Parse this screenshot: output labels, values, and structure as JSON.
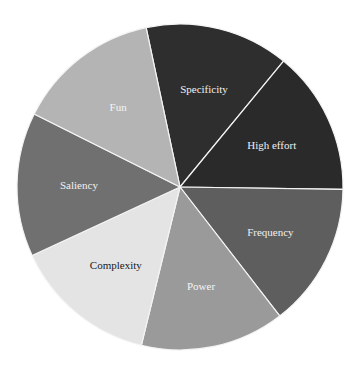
{
  "chart_data": {
    "type": "pie",
    "title": "",
    "start_angle_deg": 102,
    "direction": "clockwise",
    "slices": [
      {
        "label": "Specificity",
        "value": 14.29,
        "color": "#2e2e2e",
        "text_color": "#f0f0f0"
      },
      {
        "label": "High effort",
        "value": 14.29,
        "color": "#2a2a2a",
        "text_color": "#f0f0f0"
      },
      {
        "label": "Frequency",
        "value": 14.29,
        "color": "#5e5e5e",
        "text_color": "#f0f0f0"
      },
      {
        "label": "Power",
        "value": 14.29,
        "color": "#9a9a9a",
        "text_color": "#f5f5f5"
      },
      {
        "label": "Complexity",
        "value": 14.29,
        "color": "#e4e4e4",
        "text_color": "#1a1a1a"
      },
      {
        "label": "Saliency",
        "value": 14.29,
        "color": "#707070",
        "text_color": "#f0f0f0"
      },
      {
        "label": "Fun",
        "value": 14.29,
        "color": "#b4b4b4",
        "text_color": "#f5f5f5"
      }
    ],
    "legend": "none",
    "separator_color": "#f4f4f4"
  }
}
